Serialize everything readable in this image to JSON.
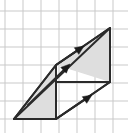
{
  "figure": {
    "canvas": {
      "width": 128,
      "height": 133
    },
    "background_color": "#ffffff",
    "grid": {
      "visible": true,
      "color": "#c9c9c9",
      "line_width": 1,
      "spacing": 18,
      "origin_x": 5,
      "origin_y": 11,
      "x_lines": [
        5,
        23,
        41,
        59,
        77,
        95,
        113
      ],
      "y_lines": [
        11,
        29,
        47,
        65,
        83,
        101,
        119
      ]
    },
    "stroke": {
      "color": "#2b2b2b",
      "width": 2
    },
    "fill": {
      "shaded_color": "#dedede",
      "unshaded_color": "#ffffff"
    },
    "vertices": {
      "A": {
        "label": "A",
        "x": 14,
        "y": 119
      },
      "B": {
        "label": "B",
        "x": 56,
        "y": 119
      },
      "C": {
        "label": "C",
        "x": 56,
        "y": 65
      },
      "D": {
        "label": "D",
        "x": 110,
        "y": 82
      },
      "E": {
        "label": "E",
        "x": 110,
        "y": 28
      }
    },
    "shaded_regions": [
      {
        "name": "lower-left-triangle",
        "points": "14,119 56,65 56,119"
      },
      {
        "name": "upper-right-triangle",
        "points": "56,65 110,28 110,82"
      }
    ],
    "outline_polygon": {
      "name": "parallelogram-outline",
      "points": "14,119 56,65 110,28 110,82 56,119"
    },
    "edges": [
      {
        "name": "edge-bottom",
        "x1": 14,
        "y1": 119,
        "x2": 56,
        "y2": 119
      },
      {
        "name": "edge-bottom-right",
        "x1": 56,
        "y1": 119,
        "x2": 110,
        "y2": 82
      },
      {
        "name": "edge-right-vertical",
        "x1": 110,
        "y1": 82,
        "x2": 110,
        "y2": 28
      },
      {
        "name": "edge-top",
        "x1": 110,
        "y1": 28,
        "x2": 56,
        "y2": 65
      },
      {
        "name": "edge-left",
        "x1": 56,
        "y1": 65,
        "x2": 14,
        "y2": 119
      },
      {
        "name": "edge-middle-vertical",
        "x1": 56,
        "y1": 65,
        "x2": 56,
        "y2": 119
      },
      {
        "name": "edge-middle-horizontal",
        "x1": 56,
        "y1": 82,
        "x2": 110,
        "y2": 82
      },
      {
        "name": "diagonal-lower",
        "x1": 14,
        "y1": 119,
        "x2": 110,
        "y2": 28
      }
    ],
    "vectors": [
      {
        "name": "vector-top",
        "x1": 56,
        "y1": 65,
        "x2": 84,
        "y2": 46,
        "direction": "up-right"
      },
      {
        "name": "vector-middle",
        "x1": 28,
        "y1": 105,
        "x2": 70,
        "y2": 64,
        "direction": "up-right"
      },
      {
        "name": "vector-bottom",
        "x1": 56,
        "y1": 119,
        "x2": 92,
        "y2": 95,
        "direction": "up-right"
      }
    ],
    "arrowhead": {
      "length": 9,
      "half_width": 4,
      "color": "#1a1a1a"
    }
  }
}
